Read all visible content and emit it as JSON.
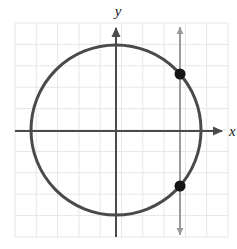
{
  "figure": {
    "title": "",
    "background_color": "#ffffff",
    "width": 237,
    "height": 249
  },
  "grid": {
    "color": "#e6e6e6",
    "left": 15,
    "top": 23,
    "right": 228,
    "bottom": 237,
    "columns": 10,
    "rows": 10,
    "cell_size": 21.3,
    "visible": true
  },
  "axes": {
    "color": "#4a4a4a",
    "stroke_width": 2,
    "origin_x": 116,
    "origin_y": 131,
    "x_axis": {
      "label": "x",
      "label_x": 229,
      "label_y": 136,
      "start_x": 15,
      "end_x": 222,
      "arrow": "right"
    },
    "y_axis": {
      "label": "y",
      "label_x": 118,
      "label_y": 16,
      "start_y": 237,
      "end_y": 28,
      "arrow": "up"
    }
  },
  "chart_data": {
    "type": "scatter",
    "title": "",
    "xlabel": "x",
    "ylabel": "y",
    "grid": true,
    "legend": "none",
    "xlim": [
      -4.74,
      5.26
    ],
    "ylim": [
      -4.98,
      5.07
    ],
    "shapes": [
      {
        "name": "circle",
        "type": "circle",
        "center_px": [
          116,
          130
        ],
        "radius_px": 85,
        "center_units": [
          0,
          0
        ],
        "radius_units": 4,
        "color": "#4a4a4a",
        "stroke_width": 3
      },
      {
        "name": "vertical-line",
        "type": "vline",
        "x_px": 180,
        "x_units": 3,
        "y_start_px": 27,
        "y_end_px": 235,
        "color": "#9a9a9a",
        "stroke_width": 2,
        "arrows": "both"
      }
    ],
    "points": [
      {
        "name": "upper-intersection",
        "px": [
          180,
          74
        ],
        "x": 3,
        "y": 2.65,
        "color": "#151515",
        "radius_px": 5.5
      },
      {
        "name": "lower-intersection",
        "px": [
          180,
          186
        ],
        "x": 3,
        "y": -2.65,
        "color": "#151515",
        "radius_px": 5.5
      }
    ]
  }
}
